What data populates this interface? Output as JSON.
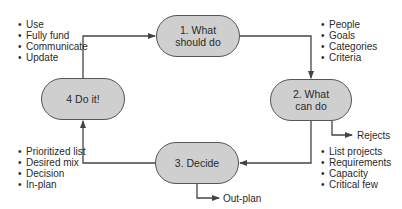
{
  "diagram": {
    "steps": [
      {
        "id": "step1",
        "label_lines": [
          "1. What",
          "should do"
        ]
      },
      {
        "id": "step2",
        "label_lines": [
          "2. What",
          "can do"
        ]
      },
      {
        "id": "step3",
        "label_lines": [
          "3. Decide"
        ]
      },
      {
        "id": "step4",
        "label_lines": [
          "4 Do it!"
        ]
      }
    ],
    "lists": {
      "step1_items": [
        "People",
        "Goals",
        "Categories",
        "Criteria"
      ],
      "step2_items": [
        "List projects",
        "Requirements",
        "Capacity",
        "Critical few"
      ],
      "step3_items": [
        "Prioritized list",
        "Desired mix",
        "Decision",
        "In-plan"
      ],
      "step4_items": [
        "Use",
        "Fully fund",
        "Communicate",
        "Update"
      ]
    },
    "outputs": {
      "rejects": "Rejects",
      "out_plan": "Out-plan"
    },
    "colors": {
      "box_fill": "#cfcfcf",
      "stroke": "#555555"
    }
  }
}
